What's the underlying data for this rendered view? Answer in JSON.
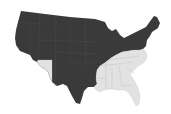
{
  "map": {
    "region": "United States (contiguous)",
    "colors": {
      "background": "#ffffff",
      "dark": "#3a3a3a",
      "light": "#e2e2e2",
      "border": "#bdbdbd"
    },
    "categories": [
      {
        "name": "dark",
        "color": "#3a3a3a"
      },
      {
        "name": "light",
        "color": "#e2e2e2"
      }
    ],
    "light_states": [
      "Arizona",
      "Arkansas",
      "Louisiana",
      "Mississippi",
      "Alabama",
      "Georgia",
      "Florida",
      "South Carolina",
      "North Carolina",
      "Tennessee",
      "Kentucky",
      "Virginia"
    ],
    "dark_states": [
      "Washington",
      "Oregon",
      "California",
      "Nevada",
      "Idaho",
      "Montana",
      "Wyoming",
      "Utah",
      "Colorado",
      "New Mexico",
      "Texas",
      "Oklahoma",
      "Kansas",
      "Nebraska",
      "South Dakota",
      "North Dakota",
      "Minnesota",
      "Iowa",
      "Missouri",
      "Wisconsin",
      "Illinois",
      "Michigan",
      "Indiana",
      "Ohio",
      "Pennsylvania",
      "New York",
      "West Virginia",
      "Maryland",
      "Delaware",
      "New Jersey",
      "Connecticut",
      "Rhode Island",
      "Massachusetts",
      "Vermont",
      "New Hampshire",
      "Maine"
    ]
  }
}
